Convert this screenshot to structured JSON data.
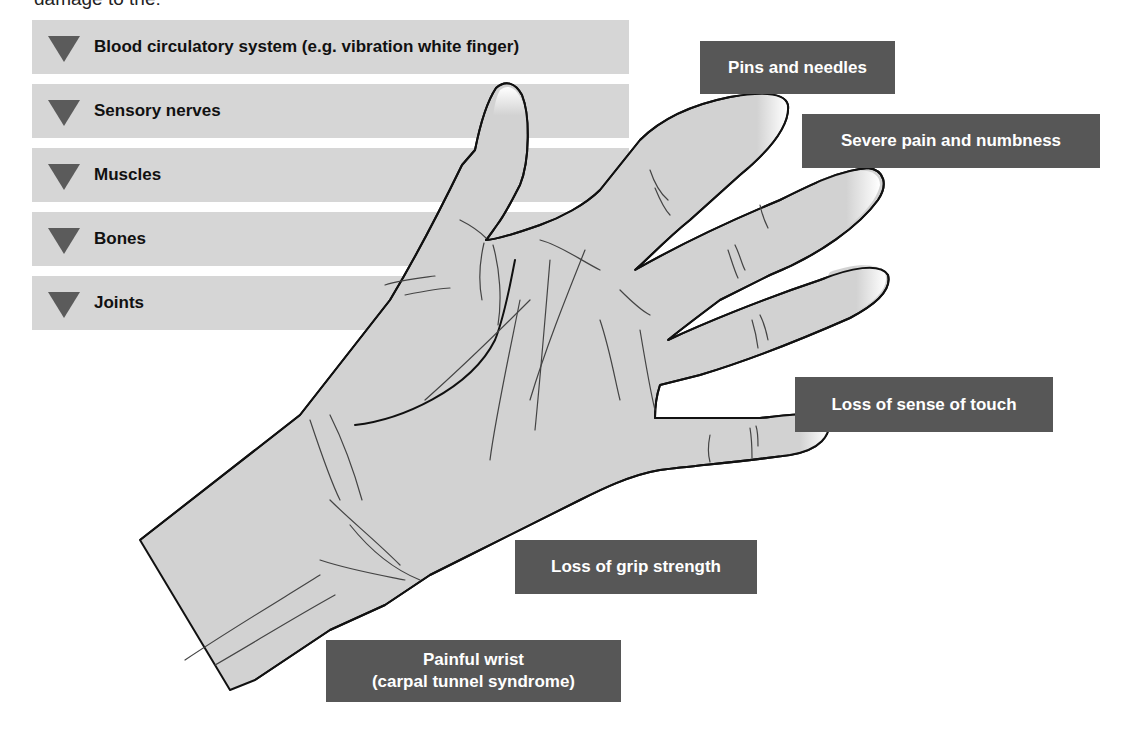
{
  "intro_text": "damage to the:",
  "damage_list": {
    "items": [
      {
        "label": "Blood circulatory system (e.g. vibration white finger)",
        "icon": "triangle-down-icon"
      },
      {
        "label": "Sensory nerves",
        "icon": "triangle-down-icon"
      },
      {
        "label": "Muscles",
        "icon": "triangle-down-icon"
      },
      {
        "label": "Bones",
        "icon": "triangle-down-icon"
      },
      {
        "label": "Joints",
        "icon": "triangle-down-icon"
      }
    ],
    "bar_color": "#d6d6d6",
    "icon_color": "#5b5b5b"
  },
  "symptom_labels": {
    "pins_and_needles": "Pins and needles",
    "severe_pain": "Severe pain and numbness",
    "loss_of_touch": "Loss of sense of touch",
    "loss_of_grip": "Loss of grip strength",
    "painful_wrist_line1": "Painful wrist",
    "painful_wrist_line2": "(carpal tunnel syndrome)",
    "label_bg_color": "#575757",
    "label_text_color": "#ffffff"
  },
  "illustration": {
    "subject": "hand-illustration",
    "skin_color": "#d2d2d2",
    "outline_color": "#111111"
  }
}
